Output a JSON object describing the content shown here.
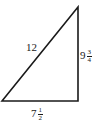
{
  "diagram": {
    "type": "right-triangle",
    "stroke_color": "#1a1a1a",
    "hypotenuse": {
      "label": "12"
    },
    "vertical_leg": {
      "whole": "9",
      "num": "3",
      "den": "4"
    },
    "horizontal_leg": {
      "whole": "7",
      "num": "1",
      "den": "2"
    }
  }
}
